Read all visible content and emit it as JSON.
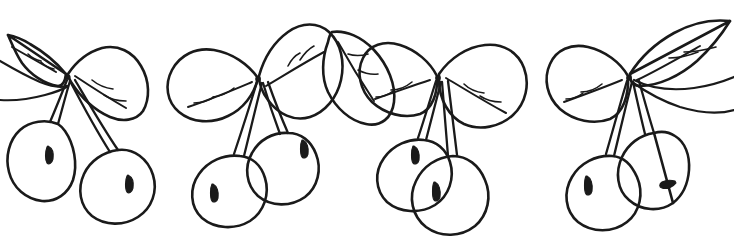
{
  "artwork": {
    "title": "Cherry Branch Border",
    "subject": "hand-drawn cherries with leaves",
    "style": "black ink line drawing, uncolored",
    "background_color": "#ffffff",
    "ink_color": "#1a1a1a",
    "width": 734,
    "height": 244,
    "description": "A horizontally repeating decorative border of hand-drawn cherry clusters. Four leaf clusters span the top, each with paired stems descending to two round cherries. Cherries carry small teardrop highlight marks. The leftmost and rightmost elements are cropped by the image edge."
  },
  "clusters": [
    {
      "name": "cluster-1",
      "leaf_count": 2,
      "cherry_count": 2,
      "cherries": [
        {
          "name": "cherry-1a",
          "highlight": "teardrop",
          "cropped": true
        },
        {
          "name": "cherry-1b",
          "highlight": "teardrop",
          "cropped": false
        }
      ]
    },
    {
      "name": "cluster-2",
      "leaf_count": 3,
      "cherry_count": 2,
      "cherries": [
        {
          "name": "cherry-2a",
          "highlight": "teardrop",
          "cropped": false
        },
        {
          "name": "cherry-2b",
          "highlight": "teardrop",
          "cropped": false
        }
      ]
    },
    {
      "name": "cluster-3",
      "leaf_count": 2,
      "cherry_count": 2,
      "cherries": [
        {
          "name": "cherry-3a",
          "highlight": "teardrop",
          "cropped": false
        },
        {
          "name": "cherry-3b",
          "highlight": "teardrop",
          "cropped": false
        }
      ]
    },
    {
      "name": "cluster-4",
      "leaf_count": 3,
      "cherry_count": 2,
      "cherries": [
        {
          "name": "cherry-4a",
          "highlight": "teardrop",
          "cropped": false
        },
        {
          "name": "cherry-4b",
          "highlight": "teardrop",
          "cropped": true
        }
      ]
    }
  ]
}
